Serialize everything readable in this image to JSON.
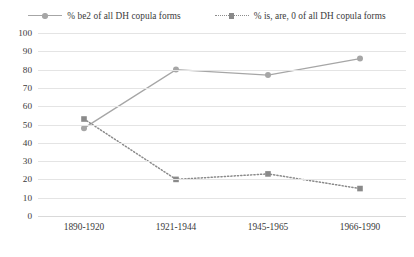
{
  "legend": {
    "position": "top",
    "entries": [
      {
        "label": "% be2 of all DH copula forms",
        "style": "solid",
        "marker": "circle",
        "color": "#a6a6a6"
      },
      {
        "label": "% is, are, 0 of all DH copula forms",
        "style": "dotted",
        "marker": "square",
        "color": "#8a8a8a"
      }
    ]
  },
  "axes": {
    "y_ticks": [
      "100",
      "90",
      "80",
      "70",
      "60",
      "50",
      "40",
      "30",
      "20",
      "10",
      "0"
    ],
    "x_ticks": [
      "1890-1920",
      "1921-1944",
      "1945-1965",
      "1966-1990"
    ],
    "xlabel": "",
    "ylabel": ""
  },
  "chart_data": {
    "type": "line",
    "title": "",
    "subtitle": "",
    "xlabel": "",
    "ylabel": "",
    "ylim": [
      0,
      100
    ],
    "ytick_step": 10,
    "grid": "horizontal",
    "legend_position": "top",
    "categories": [
      "1890-1920",
      "1921-1944",
      "1945-1965",
      "1966-1990"
    ],
    "series": [
      {
        "name": "% be2 of all DH copula forms",
        "values": [
          48,
          80,
          77,
          86
        ],
        "line_style": "solid",
        "marker": "circle",
        "color": "#a6a6a6"
      },
      {
        "name": "% is, are, 0 of all DH copula forms",
        "values": [
          53,
          20,
          23,
          15
        ],
        "line_style": "dotted",
        "marker": "square",
        "color": "#8a8a8a"
      }
    ]
  }
}
